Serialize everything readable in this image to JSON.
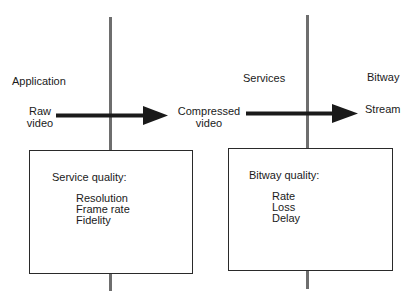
{
  "layers": {
    "application": "Application",
    "services": "Services",
    "bitway": "Bitway"
  },
  "flow": {
    "source": [
      "Raw",
      "video"
    ],
    "middle": [
      "Compressed",
      "video"
    ],
    "sink": "Stream"
  },
  "boxes": {
    "service": {
      "title": "Service quality:",
      "items": [
        "Resolution",
        "Frame rate",
        "Fidelity"
      ]
    },
    "bitway": {
      "title": "Bitway quality:",
      "items": [
        "Rate",
        "Loss",
        "Delay"
      ]
    }
  },
  "colors": {
    "divider": "#6e6e6e",
    "arrow": "#1a1a1a",
    "box_border": "#2a2a2a"
  }
}
